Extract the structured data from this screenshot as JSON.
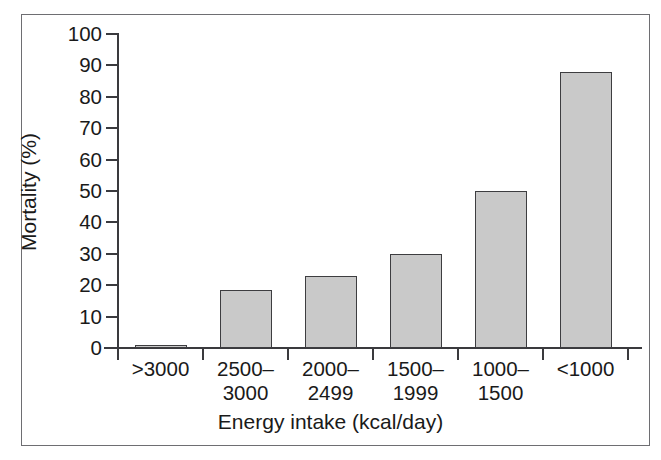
{
  "chart_data": {
    "type": "bar",
    "title": "",
    "subtitle": "",
    "xlabel": "Energy intake (kcal/day)",
    "ylabel": "Mortality (%)",
    "categories": [
      ">3000",
      "2500–3000",
      "2000–2499",
      "1500–1999",
      "1000–1500",
      "<1000"
    ],
    "category_lines": [
      [
        ">3000",
        ""
      ],
      [
        "2500–",
        "3000"
      ],
      [
        "2000–",
        "2499"
      ],
      [
        "1500–",
        "1999"
      ],
      [
        "1000–",
        "1500"
      ],
      [
        "<1000",
        ""
      ]
    ],
    "values": [
      1,
      18.5,
      23,
      30,
      50,
      88
    ],
    "ylim": [
      0,
      100
    ],
    "yticks": [
      0,
      10,
      20,
      30,
      40,
      50,
      60,
      70,
      80,
      90,
      100
    ],
    "ytick_labels": [
      "0",
      "10",
      "20",
      "30",
      "40",
      "50",
      "60",
      "70",
      "80",
      "90",
      "100"
    ],
    "grid": false,
    "legend": false,
    "legend_position": "none",
    "bar_color": "#c9c9c9",
    "bar_edge_color": "#3d3d40",
    "axis_color": "#3a3a3e",
    "frame_color": "#6e6e72",
    "background_color": "#ffffff"
  }
}
